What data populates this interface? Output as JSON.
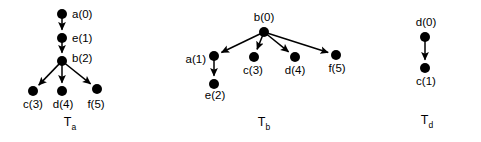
{
  "figure": {
    "background_color": "#ffffff",
    "ink_color": "#000000",
    "node_radius": 5,
    "trees": [
      {
        "id": "tree-a",
        "caption_base": "T",
        "caption_sub": "a",
        "caption_x": 70,
        "caption_y": 126,
        "nodes": [
          {
            "id": "a0",
            "label": "a(0)",
            "x": 62,
            "y": 14,
            "label_x": 72,
            "label_y": 18,
            "label_anchor": "start"
          },
          {
            "id": "e1",
            "label": "e(1)",
            "x": 62,
            "y": 38,
            "label_x": 72,
            "label_y": 42,
            "label_anchor": "start"
          },
          {
            "id": "b2",
            "label": "b(2)",
            "x": 62,
            "y": 61,
            "label_x": 72,
            "label_y": 62,
            "label_anchor": "start"
          },
          {
            "id": "c3",
            "label": "c(3)",
            "x": 33,
            "y": 91,
            "label_x": 33,
            "label_y": 108,
            "label_anchor": "middle"
          },
          {
            "id": "d4",
            "label": "d(4)",
            "x": 62,
            "y": 91,
            "label_x": 63,
            "label_y": 108,
            "label_anchor": "middle"
          },
          {
            "id": "f5",
            "label": "f(5)",
            "x": 97,
            "y": 89,
            "label_x": 96,
            "label_y": 108,
            "label_anchor": "middle"
          }
        ],
        "edges": [
          {
            "from": "a0",
            "to": "e1"
          },
          {
            "from": "e1",
            "to": "b2"
          },
          {
            "from": "b2",
            "to": "c3"
          },
          {
            "from": "b2",
            "to": "d4"
          },
          {
            "from": "b2",
            "to": "f5"
          }
        ]
      },
      {
        "id": "tree-b",
        "caption_base": "T",
        "caption_sub": "b",
        "caption_x": 264,
        "caption_y": 126,
        "nodes": [
          {
            "id": "b0",
            "label": "b(0)",
            "x": 264,
            "y": 32,
            "label_x": 264,
            "label_y": 21,
            "label_anchor": "middle"
          },
          {
            "id": "a1",
            "label": "a(1)",
            "x": 214,
            "y": 56,
            "label_x": 206,
            "label_y": 63,
            "label_anchor": "end"
          },
          {
            "id": "e2",
            "label": "e(2)",
            "x": 214,
            "y": 84,
            "label_x": 215,
            "label_y": 99,
            "label_anchor": "middle"
          },
          {
            "id": "c3",
            "label": "c(3)",
            "x": 254,
            "y": 57,
            "label_x": 253,
            "label_y": 74,
            "label_anchor": "middle"
          },
          {
            "id": "d4",
            "label": "d(4)",
            "x": 295,
            "y": 57,
            "label_x": 295,
            "label_y": 74,
            "label_anchor": "middle"
          },
          {
            "id": "f5",
            "label": "f(5)",
            "x": 336,
            "y": 55,
            "label_x": 337,
            "label_y": 72,
            "label_anchor": "middle"
          }
        ],
        "edges": [
          {
            "from": "b0",
            "to": "a1"
          },
          {
            "from": "b0",
            "to": "c3"
          },
          {
            "from": "b0",
            "to": "d4"
          },
          {
            "from": "b0",
            "to": "f5"
          },
          {
            "from": "a1",
            "to": "e2"
          }
        ]
      },
      {
        "id": "tree-d",
        "caption_base": "T",
        "caption_sub": "d",
        "caption_x": 427,
        "caption_y": 124,
        "nodes": [
          {
            "id": "d0",
            "label": "d(0)",
            "x": 425,
            "y": 37,
            "label_x": 426,
            "label_y": 26,
            "label_anchor": "middle"
          },
          {
            "id": "c1",
            "label": "c(1)",
            "x": 425,
            "y": 68,
            "label_x": 426,
            "label_y": 85,
            "label_anchor": "middle"
          }
        ],
        "edges": [
          {
            "from": "d0",
            "to": "c1"
          }
        ]
      }
    ]
  }
}
